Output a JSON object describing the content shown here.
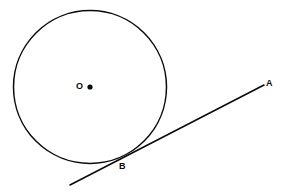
{
  "figure": {
    "background_color": "#ffffff",
    "stroke_color": "#0b0b0b",
    "canvas": {
      "width": 287,
      "height": 192
    }
  },
  "labels": {
    "center": "O",
    "tangent_far_point": "A",
    "tangent_point": "B"
  },
  "shapes": {
    "circle": {
      "name": "circle-outline",
      "cx": 90,
      "cy": 87,
      "r": 76.5,
      "stroke_width": 1.5,
      "fill": "none"
    },
    "center_dot": {
      "name": "center-point-dot",
      "cx": 90,
      "cy": 87,
      "r": 2.6,
      "fill": "#0b0b0b"
    },
    "tangent_line": {
      "name": "tangent-line-AB",
      "x1": 70,
      "y1": 185,
      "x2": 264,
      "y2": 85,
      "stroke_width": 1.6
    }
  }
}
